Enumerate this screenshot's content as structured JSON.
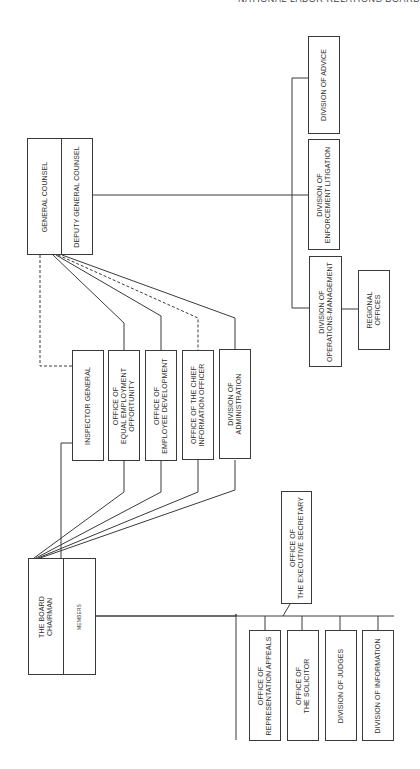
{
  "page": {
    "running_header": "NATIONAL LABOR RELATIONS BOARD",
    "page_number": "..."
  },
  "chart": {
    "orientation": "rotated-90-ccw",
    "top_left": {
      "board": {
        "primary": "THE BOARD\nCHAIRMAN",
        "secondary": "MEMBERS"
      },
      "general_counsel": {
        "primary": "GENERAL COUNSEL",
        "secondary": "DEPUTY GENERAL COUNSEL"
      }
    },
    "staff_offices": [
      {
        "label": "INSPECTOR GENERAL",
        "link_from": "board+gc",
        "line_style": "solid/dashed"
      },
      {
        "label": "OFFICE OF\nEQUAL EMPLOYMENT\nOPPORTUNITY",
        "link_from": "board+gc",
        "line_style": "solid"
      },
      {
        "label": "OFFICE OF\nEMPLOYEE DEVELOPMENT",
        "link_from": "board+gc",
        "line_style": "solid"
      },
      {
        "label": "OFFICE OF THE CHIEF\nINFORMATION OFFICER",
        "link_from": "board+gc",
        "line_style": "dashed-from-gc"
      },
      {
        "label": "DIVISION OF\nADMINISTRATION",
        "link_from": "board+gc",
        "line_style": "solid"
      }
    ],
    "gc_divisions": [
      {
        "label": "DIVISION OF ADVICE"
      },
      {
        "label": "DIVISION OF\nENFORCEMENT LITIGATION"
      },
      {
        "label": "DIVISION OF\nOPERATIONS-MANAGEMENT",
        "child": "REGIONAL\nOFFICES"
      }
    ],
    "executive_secretary": "OFFICE OF\nTHE EXECUTIVE SECRETARY",
    "board_divisions": [
      {
        "label": "OFFICE OF\nREPRESENTATION APPEALS"
      },
      {
        "label": "OFFICE OF\nTHE SOLICITOR"
      },
      {
        "label": "DIVISION OF JUDGES"
      },
      {
        "label": "DIVISION OF INFORMATION"
      }
    ]
  }
}
